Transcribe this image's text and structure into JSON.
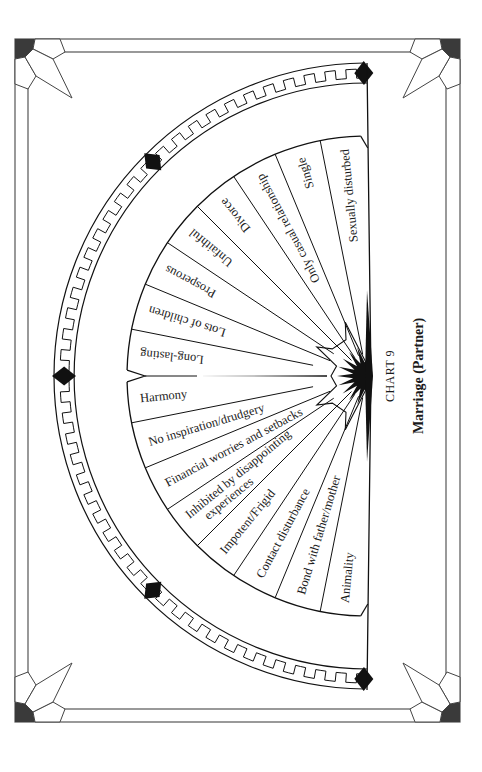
{
  "chart": {
    "number_label": "CHART 9",
    "title": "Marriage (Partner)"
  },
  "colors": {
    "ink": "#1a1a1a",
    "frame": "#555555",
    "corner_fill": "#3a3a3a",
    "background": "#ffffff"
  },
  "chart_data": {
    "type": "pendulum-fan",
    "title": "Marriage (Partner)",
    "subtitle": "CHART 9",
    "segments_top_to_bottom": [
      "Sexually disturbed",
      "Single",
      "Only casual relationship",
      "Divorce",
      "Unfaithful",
      "Prosperous",
      "Lots of children",
      "Long-lasting",
      "Harmony",
      "No inspiration/drudgery",
      "Financial worries and setbacks",
      "Inhibited by disappointing experiences",
      "Impotent/Frigid",
      "Contact disturbance",
      "Bond with father/mother",
      "Animality"
    ],
    "segment_count": 16,
    "layout": "left-facing semicircle, rotated page"
  },
  "segments": [
    {
      "label": "Sexually disturbed"
    },
    {
      "label": "Single"
    },
    {
      "label": "Only casual relationship"
    },
    {
      "label": "Divorce"
    },
    {
      "label": "Unfaithful"
    },
    {
      "label": "Prosperous"
    },
    {
      "label": "Lots of children"
    },
    {
      "label": "Long-lasting"
    },
    {
      "label": "Harmony"
    },
    {
      "label": "No inspiration/drudgery"
    },
    {
      "label": "Financial worries and setbacks"
    },
    {
      "label": "Inhibited by disappointing",
      "label2": "experiences"
    },
    {
      "label": "Impotent/Frigid"
    },
    {
      "label": "Contact disturbance"
    },
    {
      "label": "Bond with father/mother"
    },
    {
      "label": "Animality"
    }
  ]
}
